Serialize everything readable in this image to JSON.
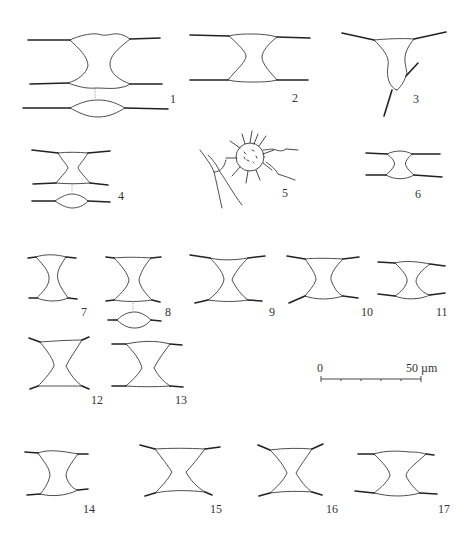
{
  "plate": {
    "figures": [
      {
        "id": "1",
        "label": "1"
      },
      {
        "id": "2",
        "label": "2"
      },
      {
        "id": "3",
        "label": "3"
      },
      {
        "id": "4",
        "label": "4"
      },
      {
        "id": "5",
        "label": "5"
      },
      {
        "id": "6",
        "label": "6"
      },
      {
        "id": "7",
        "label": "7"
      },
      {
        "id": "8",
        "label": "8"
      },
      {
        "id": "9",
        "label": "9"
      },
      {
        "id": "10",
        "label": "10"
      },
      {
        "id": "11",
        "label": "11"
      },
      {
        "id": "12",
        "label": "12"
      },
      {
        "id": "13",
        "label": "13"
      },
      {
        "id": "14",
        "label": "14"
      },
      {
        "id": "15",
        "label": "15"
      },
      {
        "id": "16",
        "label": "16"
      },
      {
        "id": "17",
        "label": "17"
      }
    ],
    "scale_bar": {
      "start_label": "0",
      "end_label": "50 µm",
      "ticks": 6
    },
    "colors": {
      "background": "#ffffff",
      "line": "#333333"
    }
  }
}
